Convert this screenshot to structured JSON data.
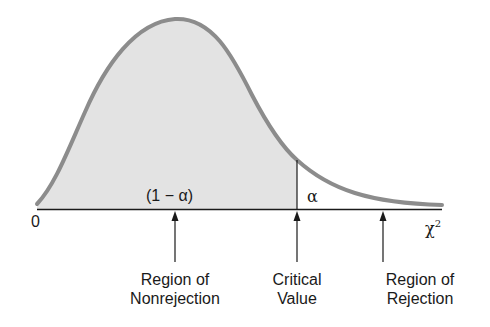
{
  "figure": {
    "colors": {
      "curve": "#8c8c8c",
      "fill_nonrejection": "#e3e3e3",
      "axis": "#1a1a1a",
      "background": "#ffffff"
    },
    "area_labels": {
      "nonrejection_area": "(1 − α)",
      "rejection_area": "α"
    },
    "axis": {
      "origin_label": "0",
      "x_label": "χ",
      "x_label_superscript": "2"
    },
    "callouts": [
      {
        "id": "nonrejection",
        "line1": "Region of",
        "line2": "Nonrejection"
      },
      {
        "id": "critical",
        "line1": "Critical",
        "line2": "Value"
      },
      {
        "id": "rejection",
        "line1": "Region of",
        "line2": "Rejection"
      }
    ]
  }
}
